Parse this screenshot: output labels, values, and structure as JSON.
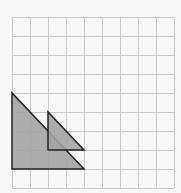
{
  "diagram": {
    "type": "grid-with-triangles",
    "background": "#f7f7f7",
    "grid": {
      "columns": 9,
      "rows": 9,
      "left": 12,
      "top": 17,
      "cell_width": 18,
      "cell_height": 19,
      "line_color": "#c8c8c8",
      "line_width": 1
    },
    "shapes": [
      {
        "name": "large-triangle",
        "kind": "right-triangle",
        "grid_vertices": [
          [
            0,
            4
          ],
          [
            0,
            8
          ],
          [
            4,
            8
          ]
        ],
        "fill": "#a3a3a3",
        "stroke": "#222222",
        "stroke_width": 1.5
      },
      {
        "name": "small-triangle",
        "kind": "right-triangle",
        "grid_vertices": [
          [
            2,
            5
          ],
          [
            2,
            7
          ],
          [
            4,
            7
          ]
        ],
        "fill": "#a3a3a3",
        "stroke": "#222222",
        "stroke_width": 1.5
      }
    ]
  }
}
